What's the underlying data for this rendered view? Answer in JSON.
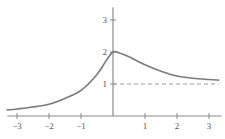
{
  "chart_data": {
    "type": "line",
    "title": "",
    "xlabel": "",
    "ylabel": "",
    "xlim": [
      -3.3,
      3.4
    ],
    "ylim": [
      0,
      3.4
    ],
    "grid": false,
    "legend": null,
    "x_ticks": [
      -3,
      -2,
      -1,
      1,
      2,
      3
    ],
    "x_tick_labels": [
      "−3",
      "−2",
      "−1",
      "1",
      "2",
      "3"
    ],
    "y_ticks": [
      1,
      2,
      3
    ],
    "y_tick_labels": [
      "1",
      "2",
      "3"
    ],
    "series": [
      {
        "name": "f(x)",
        "style": "solid",
        "color": "#7a7a7a",
        "x": [
          -3.3,
          -3.0,
          -2.5,
          -2.0,
          -1.5,
          -1.0,
          -0.5,
          -0.2,
          0.0,
          0.2,
          0.5,
          1.0,
          1.5,
          2.0,
          2.5,
          3.0,
          3.3
        ],
        "y": [
          0.19,
          0.22,
          0.28,
          0.37,
          0.55,
          0.8,
          1.3,
          1.75,
          2.0,
          1.97,
          1.85,
          1.6,
          1.4,
          1.25,
          1.18,
          1.14,
          1.12
        ]
      },
      {
        "name": "asymptote y=1",
        "style": "dashed",
        "color": "#9a9a9a",
        "x": [
          0.0,
          3.3
        ],
        "y": [
          1,
          1
        ]
      }
    ],
    "annotations": []
  },
  "layout": {
    "origin_px": [
      113,
      116
    ],
    "unit_px": 32
  }
}
